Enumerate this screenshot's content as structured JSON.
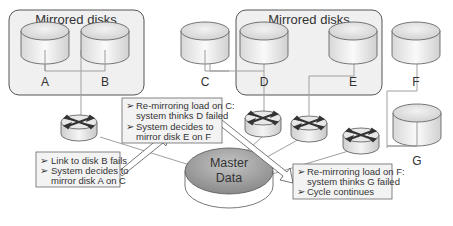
{
  "groups": [
    {
      "label": "Mirrored disks"
    },
    {
      "label": "Mirrored disks"
    }
  ],
  "disks": [
    {
      "label": "A"
    },
    {
      "label": "B"
    },
    {
      "label": "C"
    },
    {
      "label": "D"
    },
    {
      "label": "E"
    },
    {
      "label": "F"
    },
    {
      "label": "G"
    }
  ],
  "master": {
    "line1": "Master",
    "line2": "Data"
  },
  "callouts": [
    {
      "bullets": [
        "Link to disk B fails",
        "System decides to",
        "mirror disk A on C"
      ]
    },
    {
      "bullets": [
        "Re-mirroring load on C:",
        "system thinks D failed",
        "System decides to",
        "mirror disk E on F"
      ]
    },
    {
      "bullets": [
        "Re-mirroring load on F:",
        "system thinks G failed",
        "Cycle continues"
      ]
    }
  ],
  "bullet_glyph": "➢",
  "colors": {
    "group_fill": "#f1f1f1",
    "group_stroke": "#555555",
    "disk_top": "#e4e4e4",
    "disk_side": "#f4f4f4",
    "master_top": "#9e9e9e",
    "callout_fill": "#f3f3f3",
    "line": "#a8a8a8"
  }
}
